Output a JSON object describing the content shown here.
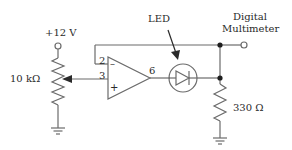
{
  "diagram": {
    "type": "circuit-schematic",
    "colors": {
      "wire": "#6b6b6b",
      "text": "#2a2a2a",
      "background": "#ffffff"
    },
    "supply": {
      "label": "+12 V"
    },
    "potentiometer": {
      "label": "10 kΩ"
    },
    "op_amp": {
      "inverting_pin": "2",
      "non_inverting_pin": "3",
      "output_pin": "6",
      "inverting_symbol": "–",
      "non_inverting_symbol": "+"
    },
    "led": {
      "label": "LED"
    },
    "meter": {
      "label_line1": "Digital",
      "label_line2": "Multimeter"
    },
    "load_resistor": {
      "label": "330 Ω"
    }
  }
}
